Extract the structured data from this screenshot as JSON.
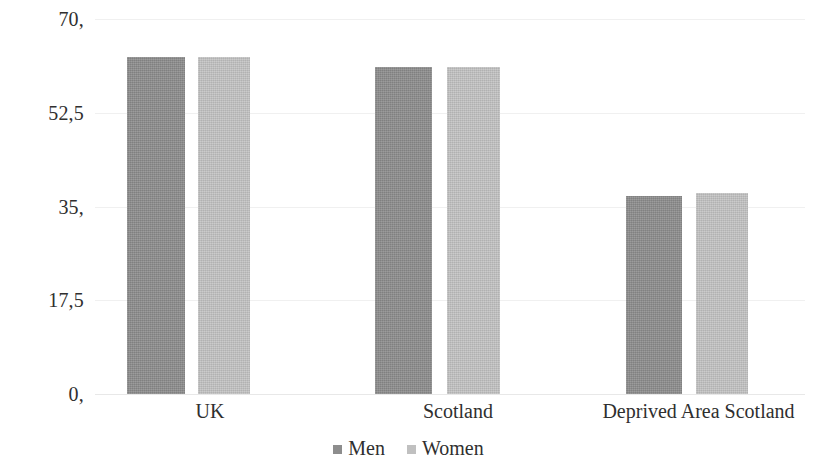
{
  "chart_data": {
    "type": "bar",
    "title": "",
    "subtitle": "",
    "xlabel": "",
    "ylabel": "",
    "categories": [
      "UK",
      "Scotland",
      "Deprived Area Scotland"
    ],
    "series": [
      {
        "name": "Men",
        "color": "#8d8d8d",
        "values": [
          63,
          61,
          37
        ]
      },
      {
        "name": "Women",
        "color": "#c0c0c0",
        "values": [
          63,
          61,
          37.5
        ]
      }
    ],
    "ylim": [
      0,
      70
    ],
    "yticks": [
      0,
      17.5,
      35,
      52.5,
      70
    ],
    "ytick_labels": [
      "0,",
      "17,5",
      "35,",
      "52,5",
      "70,"
    ],
    "grid": true,
    "grid_color": "#f0f0f0",
    "legend_position": "bottom",
    "decimal_separator": ","
  },
  "axes": {
    "y": {
      "ticks": [
        {
          "label": "70,",
          "value": 70
        },
        {
          "label": "52,5",
          "value": 52.5
        },
        {
          "label": "35,",
          "value": 35
        },
        {
          "label": "17,5",
          "value": 17.5
        },
        {
          "label": "0,",
          "value": 0
        }
      ]
    },
    "x": {
      "categories": [
        {
          "label": "UK"
        },
        {
          "label": "Scotland"
        },
        {
          "label": "Deprived Area Scotland"
        }
      ]
    }
  },
  "legend": {
    "items": [
      {
        "label": "Men",
        "color": "#8d8d8d"
      },
      {
        "label": "Women",
        "color": "#c0c0c0"
      }
    ]
  }
}
